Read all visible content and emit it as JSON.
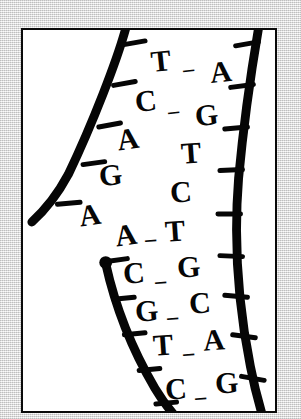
{
  "figure": {
    "style": "black-and-white hand-drawn line illustration",
    "background_color": "#eaeaea",
    "panel_color": "#ffffff",
    "ink_color": "#060606",
    "frame_color": "#0a0a0a"
  },
  "strands": {
    "left_upper": {
      "name": "left-upper-backbone",
      "bases": [
        "T",
        "C",
        "A",
        "G",
        "A"
      ],
      "paired": [
        true,
        true,
        false,
        false,
        false
      ]
    },
    "left_lower": {
      "name": "left-lower-backbone",
      "bases": [
        "A",
        "C",
        "G",
        "T",
        "C"
      ],
      "paired": [
        true,
        true,
        true,
        true,
        true
      ]
    },
    "right": {
      "name": "right-backbone",
      "bases": [
        "A",
        "G",
        "T",
        "C",
        "T",
        "G",
        "C",
        "A",
        "G"
      ],
      "paired": [
        true,
        true,
        false,
        false,
        true,
        true,
        true,
        true,
        true
      ]
    }
  },
  "base_pairs": [
    {
      "left": "T",
      "right": "A",
      "bonded": true
    },
    {
      "left": "C",
      "right": "G",
      "bonded": true
    },
    {
      "left": "A",
      "right": "T",
      "bonded": false
    },
    {
      "left": "G",
      "right": "C",
      "bonded": false
    },
    {
      "left": "A",
      "right": "T",
      "bonded": false
    },
    {
      "left": "A",
      "right": "T",
      "bonded": true
    },
    {
      "left": "C",
      "right": "G",
      "bonded": true
    },
    {
      "left": "G",
      "right": "C",
      "bonded": true
    },
    {
      "left": "T",
      "right": "A",
      "bonded": true
    },
    {
      "left": "C",
      "right": "G",
      "bonded": true
    }
  ],
  "letters": [
    {
      "id": "l1",
      "char": "T",
      "x": 128,
      "y": 16,
      "size": 30,
      "rot": -6
    },
    {
      "id": "r1",
      "char": "A",
      "x": 187,
      "y": 27,
      "size": 30,
      "rot": -6
    },
    {
      "id": "d1",
      "char": "–",
      "x": 160,
      "y": 28,
      "size": 22,
      "rot": -6
    },
    {
      "id": "l2",
      "char": "C",
      "x": 112,
      "y": 56,
      "size": 30,
      "rot": -6
    },
    {
      "id": "r2",
      "char": "G",
      "x": 172,
      "y": 70,
      "size": 30,
      "rot": -6
    },
    {
      "id": "d2",
      "char": "–",
      "x": 145,
      "y": 70,
      "size": 22,
      "rot": -6
    },
    {
      "id": "l3",
      "char": "A",
      "x": 94,
      "y": 94,
      "size": 30,
      "rot": -8
    },
    {
      "id": "r3",
      "char": "T",
      "x": 158,
      "y": 108,
      "size": 30,
      "rot": -4
    },
    {
      "id": "l4",
      "char": "G",
      "x": 76,
      "y": 130,
      "size": 30,
      "rot": -6
    },
    {
      "id": "r4",
      "char": "C",
      "x": 147,
      "y": 147,
      "size": 30,
      "rot": -4
    },
    {
      "id": "l5",
      "char": "A",
      "x": 56,
      "y": 170,
      "size": 30,
      "rot": -8
    },
    {
      "id": "r5",
      "char": "T",
      "x": 142,
      "y": 186,
      "size": 30,
      "rot": -4
    },
    {
      "id": "l6",
      "char": "A",
      "x": 92,
      "y": 190,
      "size": 30,
      "rot": -8
    },
    {
      "id": "d6",
      "char": "–",
      "x": 122,
      "y": 198,
      "size": 22,
      "rot": -4
    },
    {
      "id": "l7",
      "char": "C",
      "x": 100,
      "y": 228,
      "size": 30,
      "rot": -4
    },
    {
      "id": "r7",
      "char": "G",
      "x": 154,
      "y": 222,
      "size": 30,
      "rot": -4
    },
    {
      "id": "d7",
      "char": "–",
      "x": 132,
      "y": 240,
      "size": 22,
      "rot": -4
    },
    {
      "id": "l8",
      "char": "G",
      "x": 112,
      "y": 266,
      "size": 30,
      "rot": -4
    },
    {
      "id": "r8",
      "char": "C",
      "x": 166,
      "y": 258,
      "size": 30,
      "rot": -4
    },
    {
      "id": "d8",
      "char": "–",
      "x": 144,
      "y": 276,
      "size": 22,
      "rot": -4
    },
    {
      "id": "l9",
      "char": "T",
      "x": 130,
      "y": 300,
      "size": 30,
      "rot": -4
    },
    {
      "id": "r9",
      "char": "A",
      "x": 180,
      "y": 295,
      "size": 30,
      "rot": -4
    },
    {
      "id": "d9",
      "char": "–",
      "x": 160,
      "y": 312,
      "size": 22,
      "rot": -4
    },
    {
      "id": "l10",
      "char": "C",
      "x": 142,
      "y": 344,
      "size": 30,
      "rot": -4
    },
    {
      "id": "r10",
      "char": "G",
      "x": 192,
      "y": 338,
      "size": 30,
      "rot": -4
    },
    {
      "id": "d10",
      "char": "–",
      "x": 172,
      "y": 356,
      "size": 22,
      "rot": -4
    }
  ]
}
